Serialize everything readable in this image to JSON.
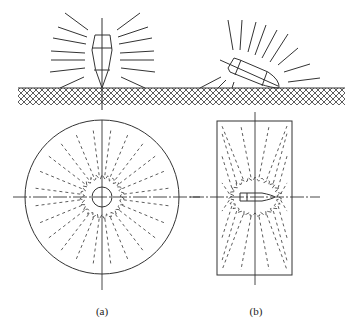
{
  "figure": {
    "panels": [
      {
        "id": "a",
        "label": "(a)",
        "description": "Vertical penetration: projectile perpendicular to target surface; circular crack/fragment pattern in plan view"
      },
      {
        "id": "b",
        "label": "(b)",
        "description": "Oblique penetration: inclined projectile; elongated rectangular pattern in plan view"
      }
    ],
    "colors": {
      "line": "#333333",
      "background": "#ffffff"
    }
  }
}
